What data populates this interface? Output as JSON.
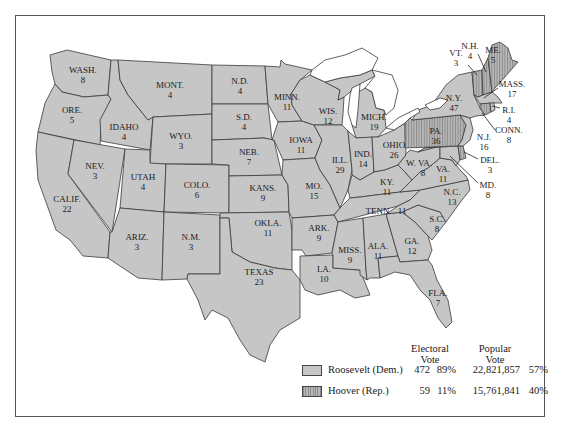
{
  "map": {
    "title": "",
    "states": [
      {
        "abbr": "WASH.",
        "ev": "8",
        "winner": "Roosevelt"
      },
      {
        "abbr": "ORE.",
        "ev": "5",
        "winner": "Roosevelt"
      },
      {
        "abbr": "CALIF.",
        "ev": "22",
        "winner": "Roosevelt"
      },
      {
        "abbr": "NEV.",
        "ev": "3",
        "winner": "Roosevelt"
      },
      {
        "abbr": "IDAHO",
        "ev": "4",
        "winner": "Roosevelt"
      },
      {
        "abbr": "MONT.",
        "ev": "4",
        "winner": "Roosevelt"
      },
      {
        "abbr": "WYO.",
        "ev": "3",
        "winner": "Roosevelt"
      },
      {
        "abbr": "UTAH",
        "ev": "4",
        "winner": "Roosevelt"
      },
      {
        "abbr": "ARIZ.",
        "ev": "3",
        "winner": "Roosevelt"
      },
      {
        "abbr": "COLO.",
        "ev": "6",
        "winner": "Roosevelt"
      },
      {
        "abbr": "N.M.",
        "ev": "3",
        "winner": "Roosevelt"
      },
      {
        "abbr": "N.D.",
        "ev": "4",
        "winner": "Roosevelt"
      },
      {
        "abbr": "S.D.",
        "ev": "4",
        "winner": "Roosevelt"
      },
      {
        "abbr": "NEB.",
        "ev": "7",
        "winner": "Roosevelt"
      },
      {
        "abbr": "KANS.",
        "ev": "9",
        "winner": "Roosevelt"
      },
      {
        "abbr": "OKLA.",
        "ev": "11",
        "winner": "Roosevelt"
      },
      {
        "abbr": "TEXAS",
        "ev": "23",
        "winner": "Roosevelt"
      },
      {
        "abbr": "MINN.",
        "ev": "11",
        "winner": "Roosevelt"
      },
      {
        "abbr": "IOWA",
        "ev": "11",
        "winner": "Roosevelt"
      },
      {
        "abbr": "MO.",
        "ev": "15",
        "winner": "Roosevelt"
      },
      {
        "abbr": "ARK.",
        "ev": "9",
        "winner": "Roosevelt"
      },
      {
        "abbr": "LA.",
        "ev": "10",
        "winner": "Roosevelt"
      },
      {
        "abbr": "WIS.",
        "ev": "12",
        "winner": "Roosevelt"
      },
      {
        "abbr": "ILL.",
        "ev": "29",
        "winner": "Roosevelt"
      },
      {
        "abbr": "MICH.",
        "ev": "19",
        "winner": "Roosevelt"
      },
      {
        "abbr": "IND.",
        "ev": "14",
        "winner": "Roosevelt"
      },
      {
        "abbr": "OHIO",
        "ev": "26",
        "winner": "Roosevelt"
      },
      {
        "abbr": "KY.",
        "ev": "11",
        "winner": "Roosevelt"
      },
      {
        "abbr": "TENN.",
        "ev": "11",
        "winner": "Roosevelt"
      },
      {
        "abbr": "MISS.",
        "ev": "9",
        "winner": "Roosevelt"
      },
      {
        "abbr": "ALA.",
        "ev": "11",
        "winner": "Roosevelt"
      },
      {
        "abbr": "GA.",
        "ev": "12",
        "winner": "Roosevelt"
      },
      {
        "abbr": "FLA.",
        "ev": "7",
        "winner": "Roosevelt"
      },
      {
        "abbr": "S.C.",
        "ev": "8",
        "winner": "Roosevelt"
      },
      {
        "abbr": "N.C.",
        "ev": "13",
        "winner": "Roosevelt"
      },
      {
        "abbr": "VA.",
        "ev": "11",
        "winner": "Roosevelt"
      },
      {
        "abbr": "W. VA.",
        "ev": "8",
        "winner": "Roosevelt"
      },
      {
        "abbr": "MD.",
        "ev": "8",
        "winner": "Roosevelt"
      },
      {
        "abbr": "DEL.",
        "ev": "3",
        "winner": "Hoover"
      },
      {
        "abbr": "PA.",
        "ev": "36",
        "winner": "Hoover"
      },
      {
        "abbr": "N.J.",
        "ev": "16",
        "winner": "Roosevelt"
      },
      {
        "abbr": "N.Y.",
        "ev": "47",
        "winner": "Roosevelt"
      },
      {
        "abbr": "CONN.",
        "ev": "8",
        "winner": "Hoover"
      },
      {
        "abbr": "R.I.",
        "ev": "4",
        "winner": "Roosevelt"
      },
      {
        "abbr": "MASS.",
        "ev": "17",
        "winner": "Roosevelt"
      },
      {
        "abbr": "VT.",
        "ev": "3",
        "winner": "Hoover"
      },
      {
        "abbr": "N.H.",
        "ev": "4",
        "winner": "Hoover"
      },
      {
        "abbr": "ME.",
        "ev": "5",
        "winner": "Hoover"
      }
    ],
    "colors": {
      "roosevelt": "#c6c6c6",
      "hoover_stripe_dark": "#8e8e8e",
      "hoover_stripe_light": "#b8b8b8",
      "border": "#3a3a3a"
    }
  },
  "legend": {
    "electoral_header_1": "Electoral",
    "electoral_header_2": "Vote",
    "popular_header_1": "Popular",
    "popular_header_2": "Vote",
    "rows": [
      {
        "candidate": "Roosevelt (Dem.)",
        "electoral": "472",
        "electoral_pct": "89%",
        "popular": "22,821,857",
        "popular_pct": "57%",
        "pattern": "solid-gray"
      },
      {
        "candidate": "Hoover (Rep.)",
        "electoral": "59",
        "electoral_pct": "11%",
        "popular": "15,761,841",
        "popular_pct": "40%",
        "pattern": "vertical-stripes"
      }
    ]
  }
}
